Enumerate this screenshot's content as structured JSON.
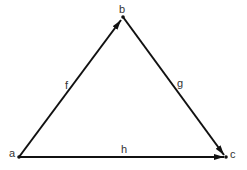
{
  "diagram": {
    "type": "directed-graph",
    "stroke_color": "#111111",
    "label_color": "#333333",
    "nodes": [
      {
        "id": "a",
        "label": "a",
        "x": 19,
        "y": 157
      },
      {
        "id": "b",
        "label": "b",
        "x": 123,
        "y": 17
      },
      {
        "id": "c",
        "label": "c",
        "x": 226,
        "y": 157
      }
    ],
    "edges": [
      {
        "id": "f",
        "label": "f",
        "from": "a",
        "to": "b"
      },
      {
        "id": "g",
        "label": "g",
        "from": "b",
        "to": "c"
      },
      {
        "id": "h",
        "label": "h",
        "from": "a",
        "to": "c"
      }
    ]
  }
}
